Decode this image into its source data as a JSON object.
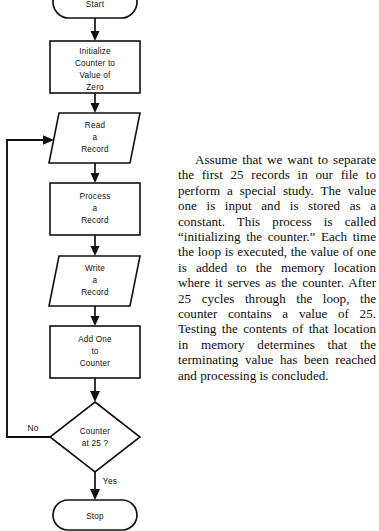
{
  "figure": {
    "type": "flowchart",
    "orientation": "vertical",
    "nodes": [
      {
        "id": "start",
        "shape": "terminator",
        "label": "Start",
        "lines": [
          "Start"
        ]
      },
      {
        "id": "initialize",
        "shape": "process",
        "label": "Initialize Counter to Value of Zero",
        "lines": [
          "Initialize",
          "Counter to",
          "Value of",
          "Zero"
        ]
      },
      {
        "id": "read",
        "shape": "input-output",
        "label": "Read a Record",
        "lines": [
          "Read",
          "a",
          "Record"
        ]
      },
      {
        "id": "process",
        "shape": "process",
        "label": "Process a Record",
        "lines": [
          "Process",
          "a",
          "Record"
        ]
      },
      {
        "id": "write",
        "shape": "input-output",
        "label": "Write a Record",
        "lines": [
          "Write",
          "a",
          "Record"
        ]
      },
      {
        "id": "addone",
        "shape": "process",
        "label": "Add One to Counter",
        "lines": [
          "Add  One",
          "to",
          "Counter"
        ]
      },
      {
        "id": "decision",
        "shape": "decision",
        "label": "Counter at 25 ?",
        "lines": [
          "Counter",
          "at  25 ?"
        ]
      },
      {
        "id": "stop",
        "shape": "terminator",
        "label": "Stop",
        "lines": [
          "Stop"
        ]
      }
    ],
    "branches": {
      "no_label": "No",
      "yes_label": "Yes"
    },
    "colors": {
      "stroke": "#111111",
      "fill": "#ffffff",
      "text": "#111111"
    }
  },
  "prose": {
    "paragraph": "Assume that we want to separate the first 25 records in our file to perform a special study. The value one is input and is stored as a constant. This process is called “initializing the counter.” Each time the loop is executed, the value of one is added to the memory location where it serves as the counter. After 25 cycles through the loop, the counter contains a value of 25. Testing the contents of that location in memory determines that the terminating value has been reached and processing is concluded."
  }
}
